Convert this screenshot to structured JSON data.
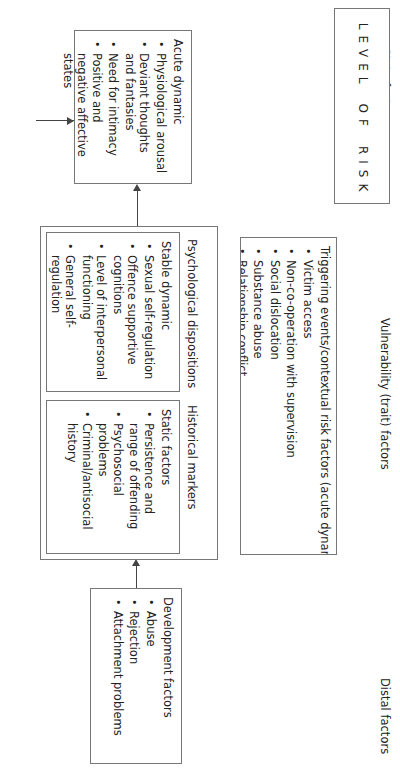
{
  "headers": {
    "distal": "Distal factors",
    "vulnerability": "Vulnerability (trait) factors",
    "state": "State factors"
  },
  "distal_box": {
    "title": "Development factors",
    "items": [
      "Abuse",
      "Rejection",
      "Attachment problems"
    ]
  },
  "vulnerability_box": {
    "historical": {
      "heading": "Historical markers",
      "title": "Static factors",
      "items": [
        "Persistence and range of offending",
        "Psychosocial problems",
        "Criminal/antisocial history"
      ]
    },
    "psychological": {
      "heading": "Psychological dispositions",
      "title": "Stable dynamic",
      "items": [
        "Sexual self-regulation",
        "Offence supportive cognitions",
        "Level of interpersonal functioning",
        "General self-regulation"
      ]
    }
  },
  "state_box": {
    "title": "Acute dynamic",
    "items": [
      "Physiological arousal",
      "Deviant thoughts and fantasies",
      "Need for intimacy",
      "Positive and negative affective states"
    ]
  },
  "trigger_box": {
    "title": "Triggering events/contextual risk factors (acute dynamic)",
    "items": [
      "Victim access",
      "Non-co-operation with supervision",
      "Social dislocation",
      "Substance abuse",
      "Relationship conflict",
      "Antisocial peers"
    ]
  },
  "risk_box": {
    "letters": [
      "L",
      "E",
      "V",
      "E",
      "L",
      "",
      "O",
      "F",
      "",
      "R",
      "I",
      "S",
      "K"
    ]
  }
}
